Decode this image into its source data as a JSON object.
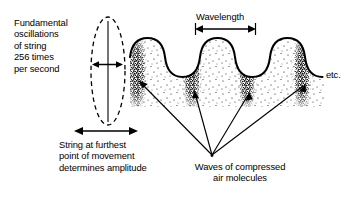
{
  "diagram": {
    "background_color": "#ffffff",
    "ink_color": "#000000",
    "labels": {
      "fundamental_oscillation": "Fundamental\noscillations\nof string\n256 times\nper second",
      "wavelength": "Wavelength",
      "etc": "etc.",
      "amplitude": "String at furthest\npoint of movement\ndetermines amplitude",
      "compressed_air": "Waves of compressed\nair molecules"
    },
    "values": {
      "frequency_hz": 256,
      "frequency_text": "256 times per second",
      "wave_cycles": 3,
      "compression_bands": 4
    },
    "elements": {
      "string_envelope": "dashed-ellipse",
      "string_rest_line": "vertical-solid-line",
      "amplitude_arrow": "double-headed-horizontal-arrow",
      "wavelength_arrow": "double-headed-horizontal-arrow-with-end-ticks",
      "pointer_arrows": "four-arrows-to-compression-bands",
      "stipple": "dotted-air-molecule-density"
    }
  }
}
